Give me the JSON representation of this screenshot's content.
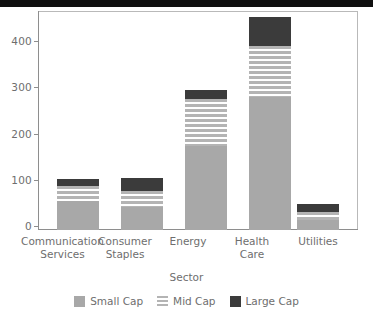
{
  "top_bar": {
    "color": "#101010"
  },
  "chart_data": {
    "type": "bar",
    "subtype": "stacked",
    "title": "",
    "xlabel": "Sector",
    "ylabel": "",
    "categories": [
      "Communication\nServices",
      "Consumer\nStaples",
      "Energy",
      "Health\nCare",
      "Utilities"
    ],
    "series": [
      {
        "name": "Small Cap",
        "color": "#a8a8a8",
        "values": [
          60,
          47,
          173,
          274,
          21
        ]
      },
      {
        "name": "Mid Cap",
        "color": "#b4b4b4",
        "values": [
          31,
          33,
          97,
          106,
          17
        ]
      },
      {
        "name": "Large Cap",
        "color": "#3b3b3b",
        "values": [
          14,
          27,
          20,
          60,
          15
        ]
      }
    ],
    "totals": [
      105,
      107,
      290,
      440,
      53
    ],
    "ylim": [
      0,
      450
    ],
    "yticks": [
      0,
      100,
      200,
      300,
      400
    ],
    "ytick_labels": [
      "0",
      "100",
      "200",
      "300",
      "400"
    ],
    "grid": false,
    "legend_position": "bottom"
  },
  "axis": {
    "y_labels": [
      "400",
      "300",
      "200",
      "100",
      "0"
    ],
    "x_title": "Sector"
  },
  "legend": {
    "items": [
      {
        "label": "Small Cap"
      },
      {
        "label": "Mid Cap"
      },
      {
        "label": "Large Cap"
      }
    ]
  }
}
